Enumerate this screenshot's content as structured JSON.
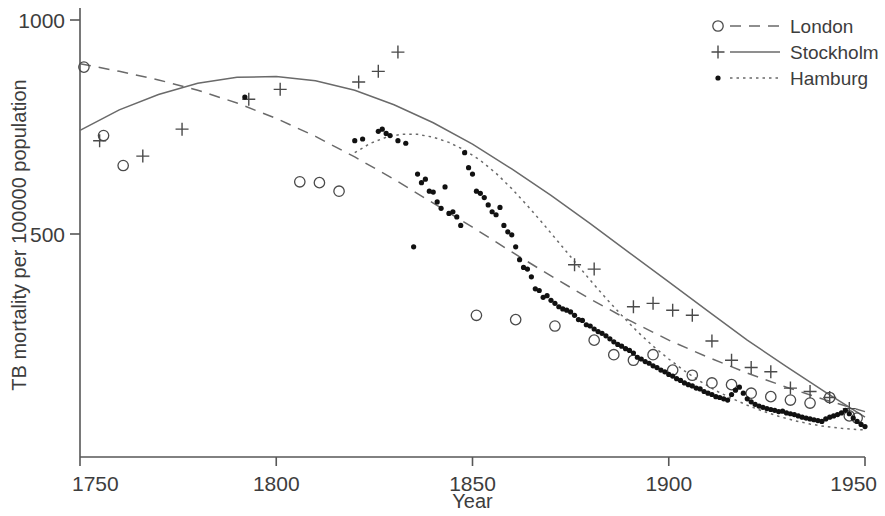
{
  "chart_data": {
    "type": "scatter",
    "title": "",
    "xlabel": "Year",
    "ylabel": "TB mortality per 100000 population",
    "xlim": [
      1750,
      1950
    ],
    "ylim": [
      0,
      1000
    ],
    "xticks": [
      1750,
      1800,
      1850,
      1900,
      1950
    ],
    "yticks": [
      500,
      1000
    ],
    "xtick_labels": [
      "1750",
      "1800",
      "1850",
      "1900",
      "1950"
    ],
    "ytick_labels": [
      "500",
      "1000"
    ],
    "grid": false,
    "legend_position": "top-right",
    "series": [
      {
        "name": "London",
        "marker": "open-circle",
        "line_style": "dashed",
        "color": "#4a4a4a",
        "points": [
          [
            1751,
            890
          ],
          [
            1756,
            730
          ],
          [
            1761,
            660
          ],
          [
            1806,
            622
          ],
          [
            1811,
            620
          ],
          [
            1816,
            600
          ],
          [
            1851,
            310
          ],
          [
            1861,
            300
          ],
          [
            1871,
            285
          ],
          [
            1881,
            252
          ],
          [
            1886,
            218
          ],
          [
            1891,
            205
          ],
          [
            1896,
            218
          ],
          [
            1901,
            182
          ],
          [
            1906,
            170
          ],
          [
            1911,
            152
          ],
          [
            1916,
            148
          ],
          [
            1921,
            128
          ],
          [
            1926,
            120
          ],
          [
            1931,
            112
          ],
          [
            1936,
            105
          ],
          [
            1941,
            118
          ],
          [
            1946,
            75
          ],
          [
            1948,
            70
          ]
        ],
        "fit": [
          [
            1750,
            898
          ],
          [
            1760,
            880
          ],
          [
            1770,
            860
          ],
          [
            1780,
            836
          ],
          [
            1790,
            806
          ],
          [
            1800,
            770
          ],
          [
            1810,
            728
          ],
          [
            1820,
            680
          ],
          [
            1830,
            628
          ],
          [
            1840,
            572
          ],
          [
            1850,
            516
          ],
          [
            1860,
            458
          ],
          [
            1870,
            402
          ],
          [
            1880,
            348
          ],
          [
            1890,
            298
          ],
          [
            1900,
            252
          ],
          [
            1910,
            212
          ],
          [
            1920,
            175
          ],
          [
            1930,
            142
          ],
          [
            1940,
            112
          ],
          [
            1950,
            85
          ]
        ]
      },
      {
        "name": "Stockholm",
        "marker": "plus",
        "line_style": "solid",
        "color": "#4a4a4a",
        "points": [
          [
            1755,
            718
          ],
          [
            1766,
            682
          ],
          [
            1776,
            745
          ],
          [
            1793,
            815
          ],
          [
            1801,
            838
          ],
          [
            1821,
            855
          ],
          [
            1826,
            880
          ],
          [
            1831,
            925
          ],
          [
            1876,
            428
          ],
          [
            1881,
            418
          ],
          [
            1891,
            330
          ],
          [
            1896,
            338
          ],
          [
            1901,
            322
          ],
          [
            1906,
            310
          ],
          [
            1911,
            250
          ],
          [
            1916,
            205
          ],
          [
            1921,
            188
          ],
          [
            1926,
            178
          ],
          [
            1931,
            140
          ],
          [
            1936,
            132
          ],
          [
            1941,
            118
          ],
          [
            1946,
            92
          ]
        ],
        "fit": [
          [
            1750,
            742
          ],
          [
            1760,
            790
          ],
          [
            1770,
            826
          ],
          [
            1780,
            852
          ],
          [
            1790,
            866
          ],
          [
            1800,
            868
          ],
          [
            1810,
            858
          ],
          [
            1820,
            836
          ],
          [
            1830,
            802
          ],
          [
            1840,
            760
          ],
          [
            1850,
            710
          ],
          [
            1860,
            652
          ],
          [
            1870,
            590
          ],
          [
            1880,
            524
          ],
          [
            1890,
            456
          ],
          [
            1900,
            388
          ],
          [
            1910,
            320
          ],
          [
            1920,
            252
          ],
          [
            1930,
            190
          ],
          [
            1940,
            130
          ],
          [
            1950,
            72
          ]
        ]
      },
      {
        "name": "Hamburg",
        "marker": "dot",
        "line_style": "dotted",
        "color": "#111111",
        "points": [
          [
            1792,
            820
          ],
          [
            1820,
            718
          ],
          [
            1822,
            722
          ],
          [
            1826,
            740
          ],
          [
            1827,
            745
          ],
          [
            1828,
            735
          ],
          [
            1829,
            730
          ],
          [
            1831,
            718
          ],
          [
            1833,
            712
          ],
          [
            1835,
            470
          ],
          [
            1836,
            640
          ],
          [
            1837,
            620
          ],
          [
            1838,
            628
          ],
          [
            1839,
            600
          ],
          [
            1840,
            598
          ],
          [
            1841,
            575
          ],
          [
            1842,
            560
          ],
          [
            1843,
            610
          ],
          [
            1844,
            548
          ],
          [
            1845,
            552
          ],
          [
            1846,
            540
          ],
          [
            1847,
            520
          ],
          [
            1848,
            690
          ],
          [
            1849,
            655
          ],
          [
            1850,
            640
          ],
          [
            1851,
            600
          ],
          [
            1852,
            595
          ],
          [
            1853,
            585
          ],
          [
            1854,
            568
          ],
          [
            1855,
            552
          ],
          [
            1856,
            545
          ],
          [
            1857,
            562
          ],
          [
            1858,
            520
          ],
          [
            1859,
            505
          ],
          [
            1860,
            498
          ],
          [
            1861,
            470
          ],
          [
            1862,
            440
          ],
          [
            1863,
            422
          ],
          [
            1864,
            418
          ],
          [
            1865,
            400
          ],
          [
            1866,
            372
          ],
          [
            1867,
            368
          ],
          [
            1868,
            352
          ],
          [
            1869,
            356
          ],
          [
            1870,
            345
          ],
          [
            1871,
            338
          ],
          [
            1872,
            330
          ],
          [
            1873,
            325
          ],
          [
            1874,
            322
          ],
          [
            1875,
            318
          ],
          [
            1876,
            310
          ],
          [
            1877,
            300
          ],
          [
            1878,
            298
          ],
          [
            1879,
            288
          ],
          [
            1880,
            285
          ],
          [
            1881,
            278
          ],
          [
            1882,
            272
          ],
          [
            1883,
            268
          ],
          [
            1884,
            262
          ],
          [
            1885,
            255
          ],
          [
            1886,
            248
          ],
          [
            1887,
            242
          ],
          [
            1888,
            238
          ],
          [
            1889,
            232
          ],
          [
            1890,
            228
          ],
          [
            1891,
            222
          ],
          [
            1892,
            212
          ],
          [
            1893,
            208
          ],
          [
            1894,
            202
          ],
          [
            1895,
            198
          ],
          [
            1896,
            192
          ],
          [
            1897,
            188
          ],
          [
            1898,
            182
          ],
          [
            1899,
            178
          ],
          [
            1900,
            172
          ],
          [
            1901,
            168
          ],
          [
            1902,
            162
          ],
          [
            1903,
            158
          ],
          [
            1904,
            152
          ],
          [
            1905,
            148
          ],
          [
            1906,
            145
          ],
          [
            1907,
            140
          ],
          [
            1908,
            138
          ],
          [
            1909,
            132
          ],
          [
            1910,
            128
          ],
          [
            1911,
            125
          ],
          [
            1912,
            120
          ],
          [
            1913,
            118
          ],
          [
            1914,
            115
          ],
          [
            1915,
            112
          ],
          [
            1916,
            125
          ],
          [
            1917,
            135
          ],
          [
            1918,
            142
          ],
          [
            1919,
            128
          ],
          [
            1920,
            115
          ],
          [
            1921,
            108
          ],
          [
            1922,
            102
          ],
          [
            1923,
            98
          ],
          [
            1924,
            95
          ],
          [
            1925,
            92
          ],
          [
            1926,
            90
          ],
          [
            1927,
            88
          ],
          [
            1928,
            85
          ],
          [
            1929,
            86
          ],
          [
            1930,
            82
          ],
          [
            1931,
            80
          ],
          [
            1932,
            78
          ],
          [
            1933,
            75
          ],
          [
            1934,
            72
          ],
          [
            1935,
            70
          ],
          [
            1936,
            68
          ],
          [
            1937,
            66
          ],
          [
            1938,
            64
          ],
          [
            1939,
            62
          ],
          [
            1940,
            68
          ],
          [
            1941,
            72
          ],
          [
            1942,
            75
          ],
          [
            1943,
            78
          ],
          [
            1944,
            82
          ],
          [
            1945,
            88
          ],
          [
            1946,
            80
          ],
          [
            1947,
            70
          ],
          [
            1948,
            62
          ],
          [
            1949,
            55
          ],
          [
            1950,
            50
          ]
        ],
        "fit": [
          [
            1820,
            690
          ],
          [
            1824,
            712
          ],
          [
            1828,
            726
          ],
          [
            1832,
            733
          ],
          [
            1836,
            733
          ],
          [
            1840,
            726
          ],
          [
            1844,
            714
          ],
          [
            1848,
            696
          ],
          [
            1852,
            672
          ],
          [
            1856,
            642
          ],
          [
            1860,
            606
          ],
          [
            1864,
            566
          ],
          [
            1868,
            524
          ],
          [
            1872,
            480
          ],
          [
            1876,
            436
          ],
          [
            1880,
            392
          ],
          [
            1884,
            350
          ],
          [
            1888,
            310
          ],
          [
            1892,
            272
          ],
          [
            1896,
            238
          ],
          [
            1900,
            208
          ],
          [
            1904,
            180
          ],
          [
            1908,
            156
          ],
          [
            1912,
            134
          ],
          [
            1916,
            116
          ],
          [
            1920,
            100
          ],
          [
            1924,
            86
          ],
          [
            1928,
            74
          ],
          [
            1932,
            64
          ],
          [
            1936,
            56
          ],
          [
            1940,
            50
          ],
          [
            1944,
            46
          ],
          [
            1950,
            42
          ]
        ]
      }
    ],
    "legend": [
      {
        "label": "London",
        "marker": "open-circle",
        "line_style": "dashed"
      },
      {
        "label": "Stockholm",
        "marker": "plus",
        "line_style": "solid"
      },
      {
        "label": "Hamburg",
        "marker": "dot",
        "line_style": "dotted"
      }
    ]
  }
}
